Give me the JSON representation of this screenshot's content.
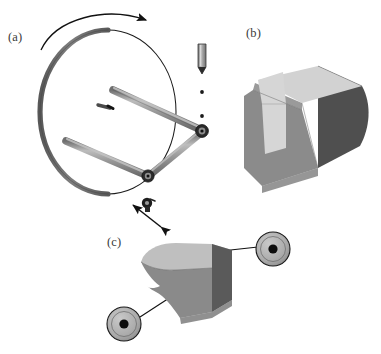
{
  "figure": {
    "width": 381,
    "height": 354,
    "background": "#ffffff",
    "type": "technical-illustration",
    "panel_count": 3
  },
  "labels": {
    "panel_a": "(a)",
    "panel_b": "(b)",
    "panel_c": "(c)"
  },
  "palette": {
    "background": "#ffffff",
    "outline": "#1a1a1a",
    "rod_light": "#b4b4b4",
    "rod_mid": "#8c8c8c",
    "rod_dark": "#6e6e6e",
    "rim_gray": "#6b6b6b",
    "hub_dark": "#222222",
    "block_top_light": "#c8c8c8",
    "block_top_lighter": "#d5d5d5",
    "block_front_mid": "#8f8f8f",
    "block_side_dark": "#565656",
    "block_groove_light": "#d9d9d9",
    "pulley_face": "#b0b0b0",
    "pulley_hub": "#111111",
    "arrow_black": "#111111"
  },
  "panel_a": {
    "name": "rotating-disc-assembly",
    "disc": {
      "name": "disc-wheel",
      "center_x": 108,
      "center_y": 112,
      "radius_x": 68,
      "radius_y": 82,
      "rim_thickness": 5
    },
    "rotation_arrow": {
      "name": "rotation-direction-arrow",
      "direction": "clockwise"
    },
    "rods": [
      {
        "name": "rod-upper",
        "from_x": 113,
        "from_y": 90,
        "to_x": 199,
        "to_y": 129
      },
      {
        "name": "rod-lower",
        "from_x": 66,
        "from_y": 141,
        "to_x": 148,
        "to_y": 176
      },
      {
        "name": "rod-connecting",
        "from_x": 148,
        "from_y": 176,
        "to_x": 202,
        "to_y": 132
      }
    ],
    "joints": [
      {
        "name": "joint-right",
        "x": 202,
        "y": 131
      },
      {
        "name": "joint-lower",
        "x": 148,
        "y": 176
      }
    ],
    "center_marker": {
      "name": "disc-center-marker",
      "x": 104,
      "y": 105
    },
    "exploded_pin": {
      "name": "exploded-pin",
      "x": 202,
      "y": 48,
      "length": 30,
      "width": 7
    },
    "alignment_dots": [
      {
        "name": "alignment-dot-upper",
        "x": 202,
        "y": 92
      },
      {
        "name": "alignment-dot-lower",
        "x": 202,
        "y": 116
      }
    ],
    "fastener": {
      "name": "small-fastener",
      "x": 148,
      "y": 203
    }
  },
  "panel_b": {
    "name": "grooved-block-3d",
    "description": "three-dimensional block with rectangular groove on top face",
    "faces": [
      "top-light",
      "groove-light",
      "front-mid",
      "side-dark"
    ]
  },
  "panel_c": {
    "name": "curved-block-with-pulleys",
    "description": "curved profile block suspended between two pulley wheels",
    "pulleys": [
      {
        "name": "pulley-upper-right",
        "x": 273,
        "y": 249,
        "radius": 17
      },
      {
        "name": "pulley-lower-left",
        "x": 124,
        "y": 324,
        "radius": 17
      }
    ],
    "cables": [
      {
        "name": "cable-upper",
        "from_x": 256,
        "from_y": 247,
        "to_x": 211,
        "to_y": 253
      },
      {
        "name": "cable-lower",
        "from_x": 141,
        "from_y": 318,
        "to_x": 178,
        "to_y": 292
      }
    ]
  },
  "transfer_arrow": {
    "name": "assembly-transfer-arrow",
    "description": "double headed arrow linking panel a to panel c",
    "from_x": 160,
    "from_y": 226,
    "to_x": 132,
    "to_y": 204
  }
}
